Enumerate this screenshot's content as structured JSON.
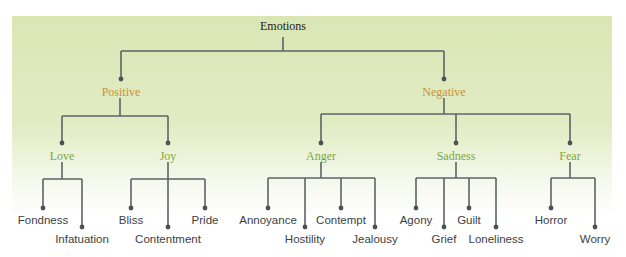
{
  "colors": {
    "line": "#5b6468",
    "level1": "#c79339",
    "level2": "#7ca842",
    "leaf": "#3c3f42"
  },
  "root": {
    "label": "Emotions",
    "x": 283,
    "y": 20
  },
  "level1": [
    {
      "label": "Positive",
      "x": 121,
      "y": 86
    },
    {
      "label": "Negative",
      "x": 444,
      "y": 86
    }
  ],
  "level2": [
    {
      "label": "Love",
      "x": 62,
      "y": 150
    },
    {
      "label": "Joy",
      "x": 168,
      "y": 150
    },
    {
      "label": "Anger",
      "x": 321,
      "y": 150
    },
    {
      "label": "Sadness",
      "x": 456,
      "y": 150
    },
    {
      "label": "Fear",
      "x": 570,
      "y": 150
    }
  ],
  "leaves": [
    {
      "label": "Fondness",
      "x": 43,
      "y": 216
    },
    {
      "label": "Infatuation",
      "x": 82,
      "y": 234
    },
    {
      "label": "Bliss",
      "x": 131,
      "y": 216
    },
    {
      "label": "Contentment",
      "x": 168,
      "y": 234
    },
    {
      "label": "Pride",
      "x": 205,
      "y": 216
    },
    {
      "label": "Annoyance",
      "x": 268,
      "y": 216
    },
    {
      "label": "Hostility",
      "x": 305,
      "y": 234
    },
    {
      "label": "Contempt",
      "x": 341,
      "y": 216
    },
    {
      "label": "Jealousy",
      "x": 375,
      "y": 234
    },
    {
      "label": "Agony",
      "x": 416,
      "y": 216
    },
    {
      "label": "Grief",
      "x": 444,
      "y": 234
    },
    {
      "label": "Guilt",
      "x": 469,
      "y": 216
    },
    {
      "label": "Loneliness",
      "x": 496,
      "y": 234
    },
    {
      "label": "Horror",
      "x": 551,
      "y": 216
    },
    {
      "label": "Worry",
      "x": 595,
      "y": 234
    }
  ]
}
